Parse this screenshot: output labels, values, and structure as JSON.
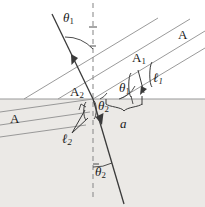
{
  "figure": {
    "panel_label": "(b)",
    "caption_type": "refraction-wavefront-diagram",
    "colors": {
      "ray": "#3a3a3a",
      "wavefront": "#8a8a8a",
      "interface": "#9a9a9a",
      "normal_dashed": "#9a9a9a",
      "medium2_fill": "#ebe9e6",
      "text": "#1a1a1a"
    },
    "labels": {
      "theta1_incident": "θ",
      "theta1_incident_sub": "1",
      "theta1_wavefront": "θ",
      "theta1_wavefront_sub": "1",
      "theta2_interface": "θ",
      "theta2_interface_sub": "2",
      "theta2_refracted": "θ",
      "theta2_refracted_sub": "2",
      "wavefront_A_upper_right": "A",
      "wavefront_A_lower_left": "A",
      "point_A1": "A",
      "point_A1_sub": "1",
      "point_A2": "A",
      "point_A2_sub": "2",
      "length_l1": "ℓ",
      "length_l1_sub": "1",
      "length_l2": "ℓ",
      "length_l2_sub": "2",
      "distance_a": "a"
    },
    "geometry": {
      "interface_y": 99,
      "normal_x": 93,
      "incident_ray_from": [
        52,
        14
      ],
      "incident_ray_to": [
        93,
        99
      ],
      "refracted_ray_from": [
        93,
        99
      ],
      "refracted_ray_to": [
        124,
        204
      ],
      "incident_angle_deg": 26,
      "refraction_angle_deg": 16
    }
  }
}
